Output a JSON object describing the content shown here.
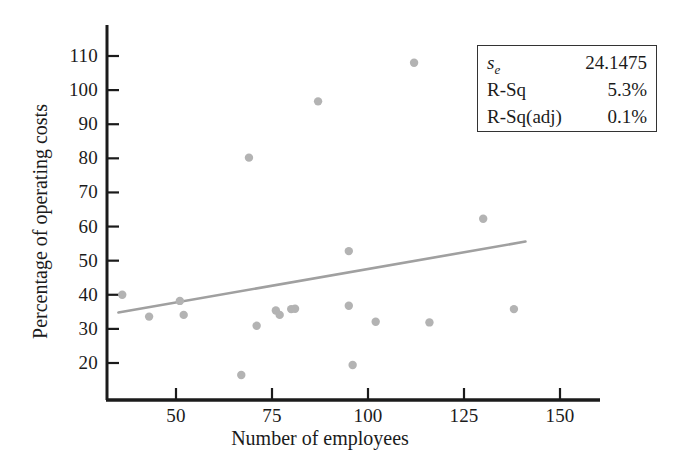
{
  "chart_data": {
    "type": "scatter",
    "title": "",
    "xlabel": "Number of employees",
    "ylabel": "Percentage of operating costs",
    "xlim": [
      30,
      158
    ],
    "ylim": [
      14,
      115
    ],
    "xticks": [
      50,
      75,
      100,
      125,
      150
    ],
    "yticks": [
      20,
      30,
      40,
      50,
      60,
      70,
      80,
      90,
      100,
      110
    ],
    "grid": false,
    "legend_position": "top-right",
    "point_color": "#b3b3b3",
    "line_color": "#a0a0a0",
    "axis_color": "#1b1b1b",
    "points": [
      {
        "x": 36,
        "y": 40.0
      },
      {
        "x": 43,
        "y": 33.6
      },
      {
        "x": 51,
        "y": 38.2
      },
      {
        "x": 52,
        "y": 34.1
      },
      {
        "x": 67,
        "y": 16.5
      },
      {
        "x": 69,
        "y": 80.2
      },
      {
        "x": 71,
        "y": 30.9
      },
      {
        "x": 76,
        "y": 35.4
      },
      {
        "x": 77,
        "y": 34.1
      },
      {
        "x": 80,
        "y": 35.8
      },
      {
        "x": 81,
        "y": 35.9
      },
      {
        "x": 87,
        "y": 96.7
      },
      {
        "x": 95,
        "y": 52.8
      },
      {
        "x": 95,
        "y": 36.8
      },
      {
        "x": 96,
        "y": 19.4
      },
      {
        "x": 102,
        "y": 32.1
      },
      {
        "x": 112,
        "y": 108.0
      },
      {
        "x": 116,
        "y": 31.9
      },
      {
        "x": 130,
        "y": 62.3
      },
      {
        "x": 138,
        "y": 35.8
      }
    ],
    "regression_line": {
      "x_start": 35,
      "y_start": 34.8,
      "x_end": 141,
      "y_end": 55.6
    }
  },
  "stats_box": {
    "rows": [
      {
        "label": "s",
        "sub": "e",
        "value": "24.1475"
      },
      {
        "label": "R-Sq",
        "sub": "",
        "value": "5.3%"
      },
      {
        "label": "R-Sq(adj)",
        "sub": "",
        "value": "0.1%"
      }
    ]
  },
  "axis_titles": {
    "x": "Number of employees",
    "y": "Percentage of operating costs"
  },
  "tick_labels": {
    "x": [
      "50",
      "75",
      "100",
      "125",
      "150"
    ],
    "y": [
      "110",
      "100",
      "90",
      "80",
      "70",
      "60",
      "50",
      "40",
      "30",
      "20"
    ]
  }
}
